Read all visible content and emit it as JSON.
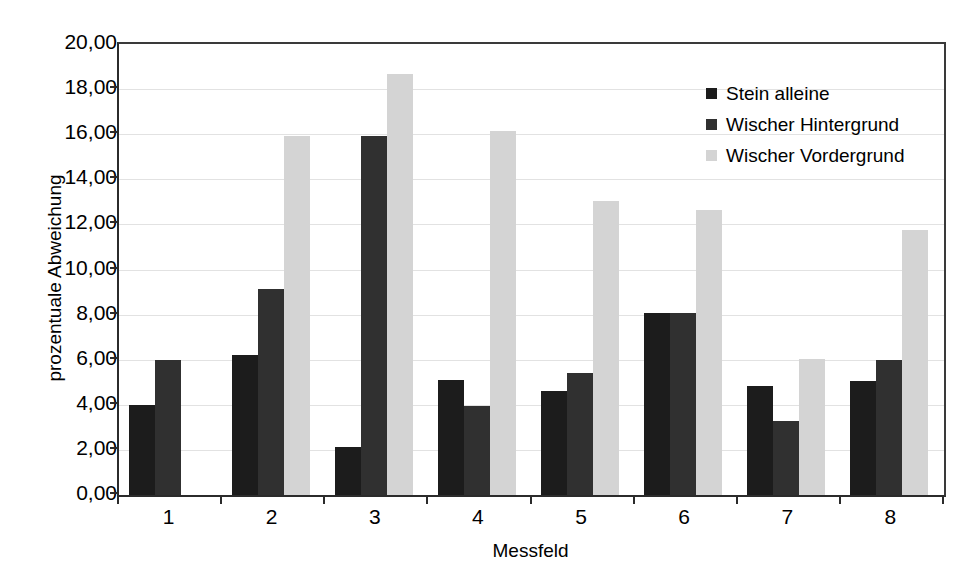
{
  "chart_data": {
    "type": "bar",
    "title": "",
    "subtitle": "",
    "xlabel": "Messfeld",
    "ylabel": "prozentuale Abweichung",
    "categories": [
      "1",
      "2",
      "3",
      "4",
      "5",
      "6",
      "7",
      "8"
    ],
    "ylim": [
      0,
      20
    ],
    "ytick_step": 2,
    "ytick_labels": [
      "0,00",
      "2,00",
      "4,00",
      "6,00",
      "8,00",
      "10,00",
      "12,00",
      "14,00",
      "16,00",
      "18,00",
      "20,00"
    ],
    "ytick_values": [
      0,
      2,
      4,
      6,
      8,
      10,
      12,
      14,
      16,
      18,
      20
    ],
    "grid": true,
    "grid_axis": "y",
    "legend_position": "top-right",
    "series": [
      {
        "name": "Stein alleine",
        "color": "#1c1c1c",
        "values": [
          4.0,
          6.2,
          2.15,
          5.1,
          4.6,
          8.05,
          4.85,
          5.05
        ]
      },
      {
        "name": "Wischer Hintergrund",
        "color": "#303030",
        "values": [
          6.0,
          9.15,
          15.9,
          3.95,
          5.4,
          8.05,
          3.3,
          6.0
        ]
      },
      {
        "name": "Wischer Vordergrund",
        "color": "#d4d4d4",
        "values": [
          null,
          15.9,
          18.65,
          16.15,
          13.05,
          12.65,
          6.05,
          11.75
        ]
      }
    ]
  },
  "axis": {
    "frame_color": "#2b2b2b",
    "gridline_color": "#e2e2e2",
    "background": "#ffffff"
  }
}
